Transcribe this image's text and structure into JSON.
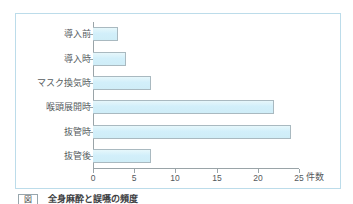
{
  "figure": {
    "frame_border_color": "#bcdcea",
    "caption_tag": "図",
    "caption_text": "全身麻酔と誤嚥の頻度"
  },
  "chart_data": {
    "type": "bar",
    "orientation": "horizontal",
    "title": "",
    "xlabel": "件数",
    "ylabel": "",
    "categories": [
      "導入前",
      "導入時",
      "マスク換気時",
      "喉頭展開時",
      "抜管時",
      "抜管後"
    ],
    "values": [
      3,
      4,
      7,
      22,
      24,
      7
    ],
    "xlim": [
      0,
      25
    ],
    "xticks": [
      0,
      5,
      10,
      15,
      20,
      25
    ],
    "xtick_labels": [
      "0",
      "5",
      "10",
      "15",
      "20",
      "25"
    ],
    "grid": false,
    "legend": null,
    "bar_fill_color": "#d2effa",
    "bar_edge_color": "#a9b9c0",
    "axis_color": "#9aa4a8"
  }
}
